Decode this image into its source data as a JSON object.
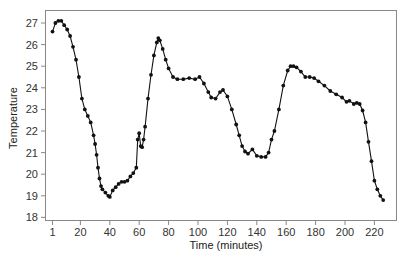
{
  "chart_data": {
    "type": "line",
    "title": "",
    "xlabel": "Time (minutes)",
    "ylabel": "Temperature",
    "xlim": [
      1,
      228
    ],
    "ylim": [
      18,
      27
    ],
    "grid": false,
    "legend": null,
    "marker": "filled-circle",
    "x_ticks": [
      1,
      20,
      40,
      60,
      80,
      100,
      120,
      140,
      160,
      180,
      200,
      220
    ],
    "y_ticks": [
      18,
      19,
      20,
      21,
      22,
      23,
      24,
      25,
      26,
      27
    ],
    "series": [
      {
        "name": "Temperature",
        "color": "#111111",
        "x": [
          1,
          3,
          5,
          7,
          9,
          11,
          13,
          15,
          17,
          19,
          21,
          23,
          25,
          27,
          29,
          30,
          31,
          32,
          33,
          34,
          35,
          37,
          39,
          40,
          42,
          44,
          46,
          48,
          50,
          52,
          54,
          56,
          58,
          59,
          60,
          61,
          62,
          63,
          64,
          66,
          68,
          70,
          72,
          73,
          74,
          76,
          78,
          80,
          83,
          86,
          90,
          94,
          98,
          101,
          104,
          107,
          109,
          112,
          115,
          117,
          120,
          123,
          126,
          128,
          130,
          132,
          134,
          137,
          140,
          143,
          146,
          148,
          150,
          152,
          155,
          158,
          161,
          163,
          165,
          167,
          170,
          173,
          176,
          179,
          182,
          186,
          190,
          194,
          198,
          201,
          203,
          206,
          208,
          210,
          212,
          214,
          216,
          218,
          220,
          222,
          224,
          226
        ],
        "values": [
          26.6,
          27.0,
          27.1,
          27.1,
          26.9,
          26.7,
          26.4,
          25.9,
          25.3,
          24.5,
          23.5,
          23.0,
          22.7,
          22.4,
          21.8,
          21.4,
          20.9,
          20.3,
          19.8,
          19.45,
          19.3,
          19.15,
          19.0,
          18.95,
          19.25,
          19.4,
          19.55,
          19.65,
          19.65,
          19.7,
          19.9,
          20.05,
          20.3,
          21.6,
          21.9,
          21.3,
          21.25,
          21.6,
          22.2,
          23.5,
          24.6,
          25.5,
          26.1,
          26.3,
          26.2,
          25.8,
          25.3,
          24.9,
          24.5,
          24.4,
          24.4,
          24.45,
          24.4,
          24.5,
          24.2,
          23.8,
          23.55,
          23.5,
          23.8,
          23.9,
          23.6,
          23.0,
          22.3,
          21.8,
          21.3,
          21.05,
          20.95,
          21.15,
          20.85,
          20.8,
          20.8,
          21.0,
          21.6,
          22.0,
          23.0,
          24.1,
          24.8,
          25.0,
          25.0,
          24.95,
          24.75,
          24.5,
          24.5,
          24.45,
          24.3,
          24.1,
          23.85,
          23.7,
          23.55,
          23.35,
          23.4,
          23.25,
          23.3,
          23.25,
          22.95,
          22.4,
          21.5,
          20.6,
          19.7,
          19.3,
          19.0,
          18.8
        ]
      }
    ]
  }
}
